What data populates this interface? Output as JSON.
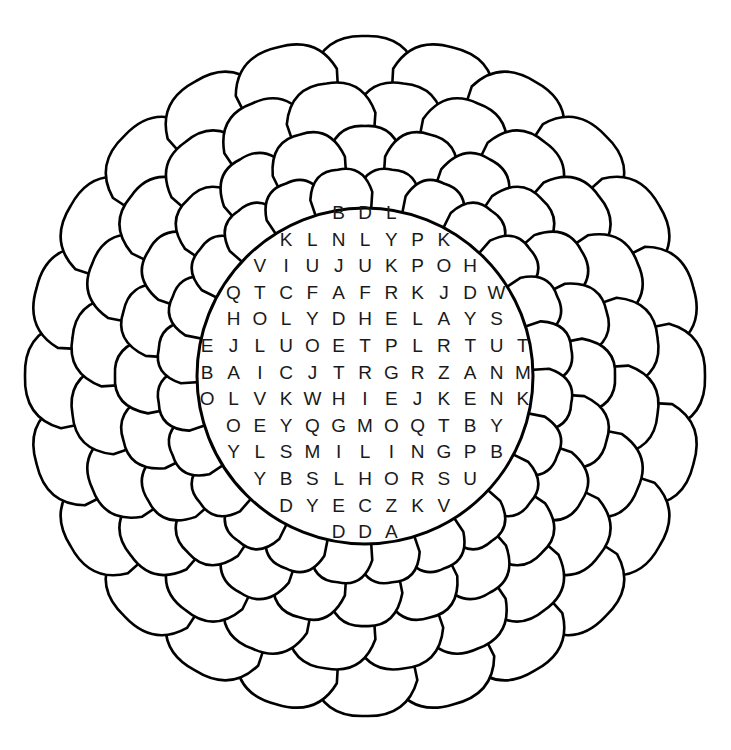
{
  "puzzle": {
    "type": "word-search",
    "shape": "flower",
    "colors": {
      "stroke": "#000000",
      "fill": "#ffffff",
      "letter": "#1a1a1a"
    },
    "rows": [
      "BDL",
      "KLNLYPK",
      "VIUJUKPOH",
      "QTCFAFRKJDW",
      "HOLYDHELAYS",
      "EJLUOETPLRTUT",
      "BAICJTRGRZANM",
      "OLVKWHIEJKENK",
      "OEYQGMOQTBY",
      "YLSMILINGPB",
      "YBSLHORSU",
      "DYECZKV",
      "DDA"
    ]
  }
}
